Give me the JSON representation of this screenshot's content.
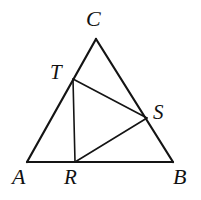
{
  "figure": {
    "type": "euclidean-geometry-diagram",
    "canvas": {
      "width": 201,
      "height": 200,
      "background": "#ffffff"
    },
    "stroke_color": "#141414",
    "outer_stroke_width": 2.2,
    "inner_stroke_width": 1.6,
    "points": [
      {
        "id": "A",
        "label": "A",
        "x": 27,
        "y": 162,
        "on": "triangle-vertex"
      },
      {
        "id": "B",
        "label": "B",
        "x": 173,
        "y": 162,
        "on": "triangle-vertex"
      },
      {
        "id": "C",
        "label": "C",
        "x": 96,
        "y": 39,
        "on": "triangle-vertex"
      },
      {
        "id": "T",
        "label": "T",
        "x": 73,
        "y": 79,
        "on": "segment-AC"
      },
      {
        "id": "S",
        "label": "S",
        "x": 147,
        "y": 118,
        "on": "segment-CB"
      },
      {
        "id": "R",
        "label": "R",
        "x": 75,
        "y": 162,
        "on": "segment-AB"
      }
    ],
    "outer_edges": [
      {
        "id": "AC",
        "from": "A",
        "to": "C"
      },
      {
        "id": "CB",
        "from": "C",
        "to": "B"
      },
      {
        "id": "AB",
        "from": "A",
        "to": "B"
      }
    ],
    "inner_edges": [
      {
        "id": "TS",
        "from": "T",
        "to": "S"
      },
      {
        "id": "TR",
        "from": "T",
        "to": "R"
      },
      {
        "id": "RS",
        "from": "R",
        "to": "S"
      }
    ],
    "labels": {
      "C": "C",
      "T": "T",
      "S": "S",
      "A": "A",
      "R": "R",
      "B": "B"
    }
  }
}
